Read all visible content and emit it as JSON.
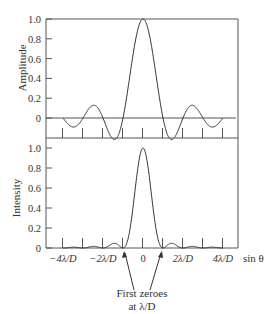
{
  "chart_data": [
    {
      "type": "line",
      "title": "",
      "ylabel": "Amplitude",
      "xlabel": "",
      "ylim": [
        -0.25,
        1.0
      ],
      "yticks": [
        "1.0",
        "0.8",
        "0.6",
        "0.4",
        "0.2",
        "0"
      ],
      "function": "sinc(x) = sin(pi x)/(pi x), x in units of lambda/D",
      "x_range": [
        -4,
        4
      ],
      "series": [
        {
          "name": "Amplitude",
          "x": [
            -4,
            -3.5,
            -3,
            -2.46,
            -2,
            -1.43,
            -1,
            -0.5,
            0,
            0.5,
            1,
            1.43,
            2,
            2.46,
            3,
            3.5,
            4
          ],
          "values": [
            0,
            -0.091,
            0,
            0.128,
            0,
            -0.217,
            0,
            0.637,
            1.0,
            0.637,
            0,
            -0.217,
            0,
            0.128,
            0,
            -0.091,
            0
          ]
        }
      ],
      "grid": false
    },
    {
      "type": "line",
      "title": "",
      "ylabel": "Intensity",
      "xlabel": "sin θ",
      "ylim": [
        0,
        1.0
      ],
      "yticks": [
        "1.0",
        "0.8",
        "0.6",
        "0.4",
        "0.2",
        "0"
      ],
      "xtick_labels": [
        "−4λ/D",
        "−2λ/D",
        "0",
        "2λ/D",
        "4λ/D"
      ],
      "function": "sinc^2(x), x in units of lambda/D",
      "x_range": [
        -4,
        4
      ],
      "series": [
        {
          "name": "Intensity",
          "x": [
            -4,
            -3.47,
            -3,
            -2.46,
            -2,
            -1.43,
            -1,
            -0.5,
            0,
            0.5,
            1,
            1.43,
            2,
            2.46,
            3,
            3.47,
            4
          ],
          "values": [
            0,
            0.008,
            0,
            0.016,
            0,
            0.047,
            0,
            0.405,
            1.0,
            0.405,
            0,
            0.047,
            0,
            0.016,
            0,
            0.008,
            0
          ]
        }
      ],
      "annotations": [
        {
          "text_lines": [
            "First zeroes",
            "at λ/D"
          ],
          "points_to_x": [
            -1,
            1
          ]
        }
      ],
      "grid": false
    }
  ],
  "upper": {
    "ylabel": "Amplitude",
    "yticks": [
      {
        "label": "1.0",
        "value": 1.0
      },
      {
        "label": "0.8",
        "value": 0.8
      },
      {
        "label": "0.6",
        "value": 0.6
      },
      {
        "label": "0.4",
        "value": 0.4
      },
      {
        "label": "0.2",
        "value": 0.2
      },
      {
        "label": "0",
        "value": 0
      }
    ]
  },
  "lower": {
    "ylabel": "Intensity",
    "yticks": [
      {
        "label": "1.0",
        "value": 1.0
      },
      {
        "label": "0.8",
        "value": 0.8
      },
      {
        "label": "0.6",
        "value": 0.6
      },
      {
        "label": "0.4",
        "value": 0.4
      },
      {
        "label": "0.2",
        "value": 0.2
      },
      {
        "label": "0",
        "value": 0
      }
    ],
    "xticks": [
      {
        "label": "−4λ/D",
        "value": -4
      },
      {
        "label": "−2λ/D",
        "value": -2
      },
      {
        "label": "0",
        "value": 0
      },
      {
        "label": "2λ/D",
        "value": 2
      },
      {
        "label": "4λ/D",
        "value": 4
      }
    ],
    "xlabel": "sin θ"
  },
  "annotation": {
    "line1": "First zeroes",
    "line2": "at λ/D"
  },
  "colors": {
    "axis": "#555555",
    "curve": "#333333",
    "text": "#333333"
  }
}
